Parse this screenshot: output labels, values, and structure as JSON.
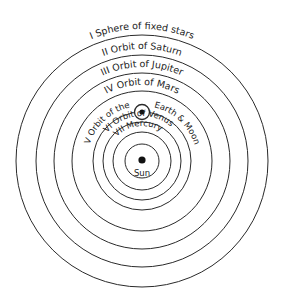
{
  "diagram": {
    "center": {
      "x": 142,
      "y": 161
    },
    "colors": {
      "line": "#2a2a2a",
      "text": "#222222",
      "background": "#ffffff"
    },
    "spheres": [
      {
        "id": "fixed-stars",
        "label": "I Sphere of fixed stars",
        "radius": 126
      },
      {
        "id": "saturn",
        "label": "II Orbit of Saturn",
        "radius": 106
      },
      {
        "id": "jupiter",
        "label": "III Orbit of Jupiter",
        "radius": 88
      },
      {
        "id": "mars",
        "label": "IV Orbit of Mars",
        "radius": 70
      },
      {
        "id": "earth",
        "label_left": "V Orbit of the",
        "label_right": "Earth & Moon",
        "radius": 49
      },
      {
        "id": "venus",
        "label": "VI Orbit of Venus",
        "radius": 39
      },
      {
        "id": "mercury",
        "label": "VII Mercury",
        "radius": 29
      },
      {
        "id": "sun",
        "label": "Sun",
        "radius": 17
      }
    ],
    "earth_marker": {
      "x": 142,
      "y": 112,
      "radius": 7
    },
    "sun_marker": {
      "x": 142,
      "y": 160,
      "radius": 3.5
    }
  }
}
